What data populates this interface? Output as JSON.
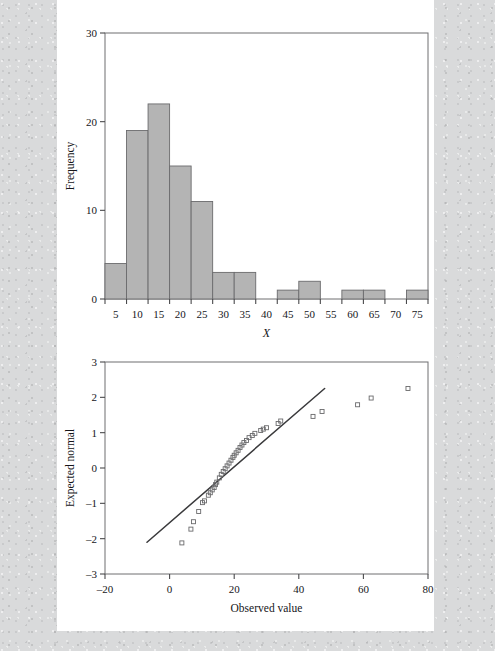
{
  "figure": {
    "background_color": "#d9dadb",
    "sheet_color": "#ffffff"
  },
  "chart_data": [
    {
      "type": "bar",
      "name": "histogram",
      "title": "",
      "xlabel": "X",
      "ylabel": "Frequency",
      "xlim": [
        2.5,
        77.5
      ],
      "ylim": [
        0,
        30
      ],
      "xticks": [
        5,
        10,
        15,
        20,
        25,
        30,
        35,
        40,
        45,
        50,
        55,
        60,
        65,
        70,
        75
      ],
      "yticks": [
        0,
        10,
        20,
        30
      ],
      "grid": false,
      "bin_width": 5,
      "bar_fill": "#b4b4b4",
      "bar_stroke": "#6b6b6d",
      "bins": [
        {
          "left": 2.5,
          "right": 7.5,
          "center": 5,
          "frequency": 4
        },
        {
          "left": 7.5,
          "right": 12.5,
          "center": 10,
          "frequency": 19
        },
        {
          "left": 12.5,
          "right": 17.5,
          "center": 15,
          "frequency": 22
        },
        {
          "left": 17.5,
          "right": 22.5,
          "center": 20,
          "frequency": 15
        },
        {
          "left": 22.5,
          "right": 27.5,
          "center": 25,
          "frequency": 11
        },
        {
          "left": 27.5,
          "right": 32.5,
          "center": 30,
          "frequency": 3
        },
        {
          "left": 32.5,
          "right": 37.5,
          "center": 35,
          "frequency": 3
        },
        {
          "left": 37.5,
          "right": 42.5,
          "center": 40,
          "frequency": 0
        },
        {
          "left": 42.5,
          "right": 47.5,
          "center": 45,
          "frequency": 1
        },
        {
          "left": 47.5,
          "right": 52.5,
          "center": 50,
          "frequency": 2
        },
        {
          "left": 52.5,
          "right": 57.5,
          "center": 55,
          "frequency": 0
        },
        {
          "left": 57.5,
          "right": 62.5,
          "center": 60,
          "frequency": 1
        },
        {
          "left": 62.5,
          "right": 67.5,
          "center": 65,
          "frequency": 1
        },
        {
          "left": 67.5,
          "right": 72.5,
          "center": 70,
          "frequency": 0
        },
        {
          "left": 72.5,
          "right": 77.5,
          "center": 75,
          "frequency": 1
        }
      ]
    },
    {
      "type": "scatter",
      "name": "normal-qq-plot",
      "title": "",
      "xlabel": "Observed value",
      "ylabel": "Expected normal",
      "xlim": [
        -20,
        80
      ],
      "ylim": [
        -3,
        3
      ],
      "xticks": [
        -20,
        0,
        20,
        40,
        60,
        80
      ],
      "yticks": [
        -3,
        -2,
        -1,
        0,
        1,
        2,
        3
      ],
      "xtick_labels": [
        "–20",
        "0",
        "20",
        "40",
        "60",
        "80"
      ],
      "ytick_labels": [
        "–3",
        "–2",
        "–1",
        "0",
        "1",
        "2",
        "3"
      ],
      "grid": false,
      "marker": "open-square",
      "marker_stroke": "#6a6a6c",
      "reference_line": {
        "x": [
          -7.0,
          48.0
        ],
        "y": [
          -2.1,
          2.25
        ],
        "color": "#3a3a3c"
      },
      "points": [
        {
          "x": 3.8,
          "y": -2.12
        },
        {
          "x": 6.6,
          "y": -1.73
        },
        {
          "x": 7.4,
          "y": -1.52
        },
        {
          "x": 9.0,
          "y": -1.23
        },
        {
          "x": 10.2,
          "y": -0.98
        },
        {
          "x": 10.8,
          "y": -0.93
        },
        {
          "x": 12.0,
          "y": -0.77
        },
        {
          "x": 12.6,
          "y": -0.7
        },
        {
          "x": 13.2,
          "y": -0.62
        },
        {
          "x": 13.8,
          "y": -0.55
        },
        {
          "x": 14.2,
          "y": -0.47
        },
        {
          "x": 14.6,
          "y": -0.4
        },
        {
          "x": 15.4,
          "y": -0.28
        },
        {
          "x": 16.0,
          "y": -0.18
        },
        {
          "x": 16.6,
          "y": -0.1
        },
        {
          "x": 17.2,
          "y": -0.02
        },
        {
          "x": 17.8,
          "y": 0.06
        },
        {
          "x": 18.4,
          "y": 0.14
        },
        {
          "x": 19.0,
          "y": 0.22
        },
        {
          "x": 19.6,
          "y": 0.3
        },
        {
          "x": 20.0,
          "y": 0.36
        },
        {
          "x": 20.6,
          "y": 0.43
        },
        {
          "x": 21.2,
          "y": 0.5
        },
        {
          "x": 21.8,
          "y": 0.58
        },
        {
          "x": 22.4,
          "y": 0.65
        },
        {
          "x": 23.0,
          "y": 0.72
        },
        {
          "x": 23.8,
          "y": 0.78
        },
        {
          "x": 24.6,
          "y": 0.86
        },
        {
          "x": 25.6,
          "y": 0.92
        },
        {
          "x": 26.4,
          "y": 0.98
        },
        {
          "x": 28.2,
          "y": 1.06
        },
        {
          "x": 29.0,
          "y": 1.1
        },
        {
          "x": 30.0,
          "y": 1.14
        },
        {
          "x": 33.6,
          "y": 1.26
        },
        {
          "x": 34.4,
          "y": 1.33
        },
        {
          "x": 44.4,
          "y": 1.46
        },
        {
          "x": 47.2,
          "y": 1.6
        },
        {
          "x": 58.2,
          "y": 1.79
        },
        {
          "x": 62.4,
          "y": 1.98
        },
        {
          "x": 73.8,
          "y": 2.25
        }
      ]
    }
  ]
}
